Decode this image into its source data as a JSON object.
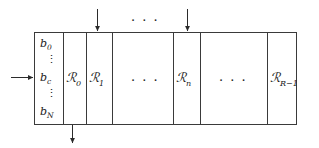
{
  "figure": {
    "colors": {
      "stroke": "#3a3a3a",
      "text": "#1a1a1a",
      "background": "#ffffff"
    },
    "buffer_column": {
      "entries": [
        {
          "label": "b",
          "sub": "0"
        },
        {
          "label": "b",
          "sub": "c"
        },
        {
          "label": "b",
          "sub": "N"
        }
      ],
      "vertical_ellipsis": "⋮"
    },
    "regions": [
      {
        "label": "ℛ",
        "sub": "0"
      },
      {
        "label": "ℛ",
        "sub": "1"
      },
      {
        "label": "ℛ",
        "sub": "n"
      },
      {
        "label": "ℛ",
        "sub": "R−1"
      }
    ],
    "ellipses": {
      "horizontal": "· · ·",
      "top_between_arrows": "· · ·"
    },
    "arrows": [
      {
        "name": "input-arrow-left",
        "direction": "right"
      },
      {
        "name": "input-arrow-top-first",
        "direction": "down"
      },
      {
        "name": "input-arrow-top-second",
        "direction": "down"
      },
      {
        "name": "output-arrow-bottom",
        "direction": "down"
      }
    ]
  }
}
